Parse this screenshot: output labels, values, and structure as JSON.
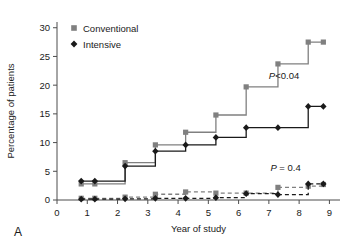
{
  "panel": {
    "label": "A"
  },
  "legend": {
    "position": "top-left-inside",
    "items": [
      {
        "label": "Conventional",
        "marker": "square-marker-icon",
        "color": "#808080"
      },
      {
        "label": "Intensive",
        "marker": "diamond-marker-icon",
        "color": "#1a1a1a"
      }
    ]
  },
  "annotations": [
    {
      "name": "p-value-primary",
      "prefix": "P",
      "text": "<0.04",
      "x": 7.0,
      "y": 21.0
    },
    {
      "name": "p-value-secondary",
      "prefix": "P",
      "text": " = 0.4",
      "x": 7.05,
      "y": 5.1
    }
  ],
  "chart_data": {
    "type": "line",
    "title": "",
    "subtitle": "",
    "xlabel": "Year of study",
    "ylabel": "Percentage of patients",
    "xlim": [
      0,
      9.35
    ],
    "ylim": [
      0,
      31
    ],
    "xticks": [
      0,
      1,
      2,
      3,
      4,
      5,
      6,
      7,
      8,
      9
    ],
    "xticklabels": [
      "0",
      "1",
      "2",
      "3",
      "4",
      "5",
      "6",
      "7",
      "8",
      "9"
    ],
    "yticks": [
      0,
      5,
      10,
      15,
      20,
      25,
      30
    ],
    "yticklabels": [
      "0",
      "5",
      "10",
      "15",
      "20",
      "25",
      "30"
    ],
    "grid": false,
    "legend_position": "upper left",
    "step_style": "post",
    "series": [
      {
        "name": "Conventional",
        "group": "primary",
        "style": "solid",
        "color": "#808080",
        "marker": "square",
        "x": [
          0.8,
          1.25,
          2.25,
          3.25,
          4.25,
          5.25,
          6.25,
          7.3,
          8.3,
          8.8
        ],
        "values": [
          2.8,
          2.8,
          6.5,
          9.6,
          11.8,
          14.8,
          19.7,
          23.7,
          27.5,
          27.5
        ]
      },
      {
        "name": "Intensive",
        "group": "primary",
        "style": "solid",
        "color": "#1a1a1a",
        "marker": "diamond",
        "x": [
          0.8,
          1.25,
          2.25,
          3.25,
          4.25,
          5.25,
          6.25,
          7.3,
          8.3,
          8.8
        ],
        "values": [
          3.3,
          3.3,
          5.9,
          8.5,
          9.6,
          10.9,
          12.6,
          12.6,
          16.3,
          16.3
        ]
      },
      {
        "name": "Conventional",
        "group": "secondary",
        "style": "dashed",
        "color": "#808080",
        "marker": "square",
        "x": [
          0.8,
          1.25,
          2.25,
          3.25,
          4.25,
          5.25,
          6.25,
          7.3,
          8.3,
          8.8
        ],
        "values": [
          0.3,
          0.3,
          0.5,
          1.0,
          1.4,
          1.2,
          1.2,
          2.2,
          2.4,
          2.7
        ]
      },
      {
        "name": "Intensive",
        "group": "secondary",
        "style": "dashed",
        "color": "#1a1a1a",
        "marker": "diamond",
        "x": [
          0.8,
          1.25,
          2.25,
          3.25,
          4.25,
          5.25,
          6.25,
          7.3,
          8.3,
          8.8
        ],
        "values": [
          0.15,
          0.15,
          0.2,
          0.3,
          0.3,
          0.4,
          1.1,
          0.95,
          2.8,
          2.8
        ]
      }
    ]
  }
}
